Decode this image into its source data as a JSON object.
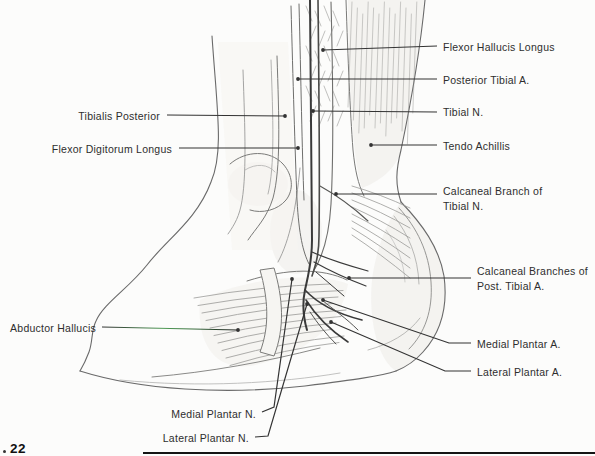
{
  "figure_number": "22",
  "labels": {
    "flexor_hallucis_longus": {
      "text": "Flexor Hallucis Longus"
    },
    "posterior_tibial_a": {
      "text": "Posterior Tibial A."
    },
    "tibial_n": {
      "text": "Tibial N."
    },
    "tendo_achillis": {
      "text": "Tendo Achillis"
    },
    "calcaneal_branch_tibial_n": {
      "text": "Calcaneal Branch of Tibial N."
    },
    "calcaneal_branches_post_tibial_a": {
      "text": "Calcaneal Branches of Post. Tibial A."
    },
    "medial_plantar_a": {
      "text": "Medial Plantar A."
    },
    "lateral_plantar_a": {
      "text": "Lateral Plantar A."
    },
    "tibialis_posterior": {
      "text": "Tibialis Posterior"
    },
    "flexor_digitorum_longus": {
      "text": "Flexor Digitorum Longus"
    },
    "abductor_hallucis": {
      "text": "Abductor Hallucis"
    },
    "medial_plantar_n": {
      "text": "Medial Plantar N."
    },
    "lateral_plantar_n": {
      "text": "Lateral Plantar N."
    }
  },
  "colors": {
    "background": "#fcfcfb",
    "outline": "#6a6a6a",
    "dark_ink": "#3a3a3a",
    "text": "#2e2e2e",
    "leader": "#333333",
    "leader_green_tint": "#4f9b55",
    "bottom_rule": "#141414"
  }
}
